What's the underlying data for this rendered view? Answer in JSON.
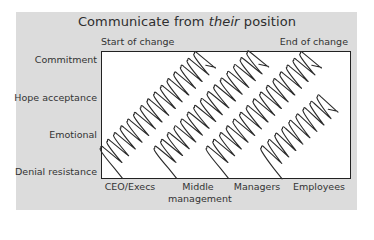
{
  "title": {
    "prefix": "Communicate from ",
    "emphasis": "their",
    "suffix": " position"
  },
  "top_labels": {
    "start": "Start of change",
    "end": "End of change"
  },
  "y_axis": {
    "levels": [
      "Commitment",
      "Hope acceptance",
      "Emotional",
      "Denial resistance"
    ]
  },
  "x_axis": {
    "groups": [
      "CEO/Execs",
      "Middle",
      "management",
      "Managers",
      "Employees"
    ],
    "group_labels": [
      "CEO/Execs",
      "Middle management",
      "Managers",
      "Employees"
    ]
  },
  "colors": {
    "panel": "#dcdcdc",
    "frame": "#ffffff",
    "stroke": "#2a2a2a",
    "text": "#333333"
  },
  "coils": [
    {
      "group": "CEO/Execs",
      "from": [
        106,
        160
      ],
      "to": [
        212,
        53
      ]
    },
    {
      "group": "Middle management",
      "from": [
        160,
        160
      ],
      "to": [
        264,
        53
      ]
    },
    {
      "group": "Managers",
      "from": [
        212,
        160
      ],
      "to": [
        318,
        53
      ]
    },
    {
      "group": "Employees",
      "from": [
        266,
        160
      ],
      "to": [
        333,
        99
      ]
    }
  ]
}
